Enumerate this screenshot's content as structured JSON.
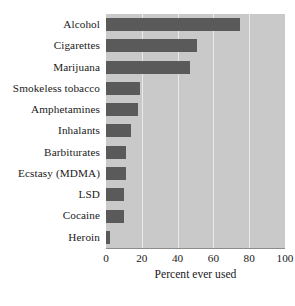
{
  "chart_data": {
    "type": "bar",
    "orientation": "horizontal",
    "title": "",
    "xlabel": "Percent ever used",
    "ylabel": "",
    "xlim": [
      0,
      100
    ],
    "xticks": [
      0,
      20,
      40,
      60,
      80,
      100
    ],
    "xtick_labels": [
      "0",
      "20",
      "40",
      "60",
      "80",
      "100"
    ],
    "grid": true,
    "grid_axis": "x",
    "legend": null,
    "categories": [
      "Alcohol",
      "Cigarettes",
      "Marijuana",
      "Smokeless tobacco",
      "Amphetamines",
      "Inhalants",
      "Barbiturates",
      "Ecstasy (MDMA)",
      "LSD",
      "Cocaine",
      "Heroin"
    ],
    "values": [
      75,
      51,
      47,
      19,
      18,
      14,
      11,
      11,
      10,
      10,
      2
    ],
    "colors": {
      "bar": "#5a5a5a",
      "plot_background": "#c9c9c9",
      "gridline": "#eceae5",
      "figure_background": "#ffffff",
      "text": "#1a1a1a",
      "axis_line": "#8c8c8c"
    }
  }
}
